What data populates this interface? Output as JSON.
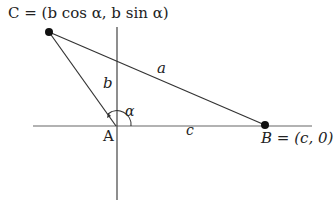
{
  "diagram": {
    "points": {
      "C": {
        "label": "C = (b cos α, b sin α)",
        "x": 49,
        "y": 32
      },
      "A": {
        "label": "A",
        "x": 116,
        "y": 126
      },
      "B": {
        "label": "B = (c, 0)",
        "x": 265,
        "y": 125
      }
    },
    "sides": {
      "a": "a",
      "b": "b",
      "c": "c"
    },
    "angle": "α",
    "colors": {
      "line": "#333333",
      "axis": "#555555",
      "dot": "#111111"
    }
  }
}
